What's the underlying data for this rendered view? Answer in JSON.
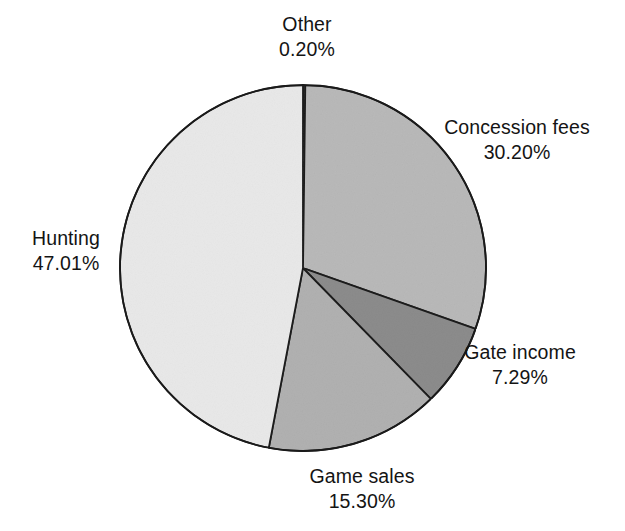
{
  "chart_data": {
    "type": "pie",
    "title": "",
    "subtitle": "",
    "xlabel": "",
    "ylabel": "",
    "grid": false,
    "legend_position": "none",
    "label_format": "name above percent, two decimals with percent sign",
    "start_angle_deg": 0,
    "direction": "clockwise",
    "units": "percent",
    "total": 100.0,
    "categories": [
      "Other",
      "Concession fees",
      "Gate income",
      "Game sales",
      "Hunting"
    ],
    "values": [
      0.2,
      30.2,
      7.29,
      15.3,
      47.01
    ],
    "value_labels": [
      "0.20%",
      "30.20%",
      "7.29%",
      "15.30%",
      "47.01%"
    ],
    "slices": [
      {
        "name": "Other",
        "value": 0.2,
        "value_label": "0.20%",
        "color": "#3a3a3a",
        "label_position": "outside-top"
      },
      {
        "name": "Concession fees",
        "value": 30.2,
        "value_label": "30.20%",
        "color": "#b9b9b9",
        "label_position": "outside-upper-right"
      },
      {
        "name": "Gate income",
        "value": 7.29,
        "value_label": "7.29%",
        "color": "#8c8c8c",
        "label_position": "outside-lower-right"
      },
      {
        "name": "Game sales",
        "value": 15.3,
        "value_label": "15.30%",
        "color": "#b1b1b1",
        "label_position": "outside-bottom"
      },
      {
        "name": "Hunting",
        "value": 47.01,
        "value_label": "47.01%",
        "color": "#e9e9e9",
        "label_position": "outside-left"
      }
    ],
    "geometry": {
      "center_x": 303,
      "center_y": 268,
      "radius": 183
    },
    "style": {
      "background": "#ffffff",
      "outline_color": "#1a1a1a",
      "outline_width": 1.8,
      "text_color": "#141414"
    }
  },
  "labels": {
    "other": {
      "name": "Other",
      "value": "0.20%"
    },
    "concession": {
      "name": "Concession fees",
      "value": "30.20%"
    },
    "gate": {
      "name": "Gate income",
      "value": "7.29%"
    },
    "game": {
      "name": "Game sales",
      "value": "15.30%"
    },
    "hunting": {
      "name": "Hunting",
      "value": "47.01%"
    }
  }
}
